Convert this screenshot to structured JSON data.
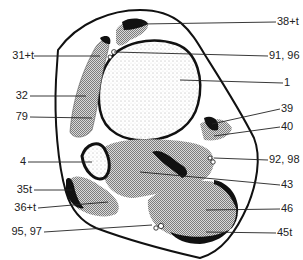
{
  "figure": {
    "type": "anatomical cross-section diagram",
    "colors": {
      "outline": "#111111",
      "stipple": "#9a9a9a",
      "background": "#ffffff"
    }
  },
  "labels": {
    "left": [
      {
        "text": "31+t",
        "y": 56
      },
      {
        "text": "32",
        "y": 96
      },
      {
        "text": "79",
        "y": 117
      },
      {
        "text": "4",
        "y": 162
      },
      {
        "text": "35t",
        "y": 190
      },
      {
        "text": "36+t",
        "y": 208
      },
      {
        "text": "95, 97",
        "y": 232
      }
    ],
    "right": [
      {
        "text": "38+t",
        "y": 22
      },
      {
        "text": "91, 96",
        "y": 56
      },
      {
        "text": "1",
        "y": 83
      },
      {
        "text": "39",
        "y": 109
      },
      {
        "text": "40",
        "y": 127
      },
      {
        "text": "92, 98",
        "y": 160
      },
      {
        "text": "43",
        "y": 185
      },
      {
        "text": "46",
        "y": 209
      },
      {
        "text": "45t",
        "y": 233
      }
    ]
  }
}
